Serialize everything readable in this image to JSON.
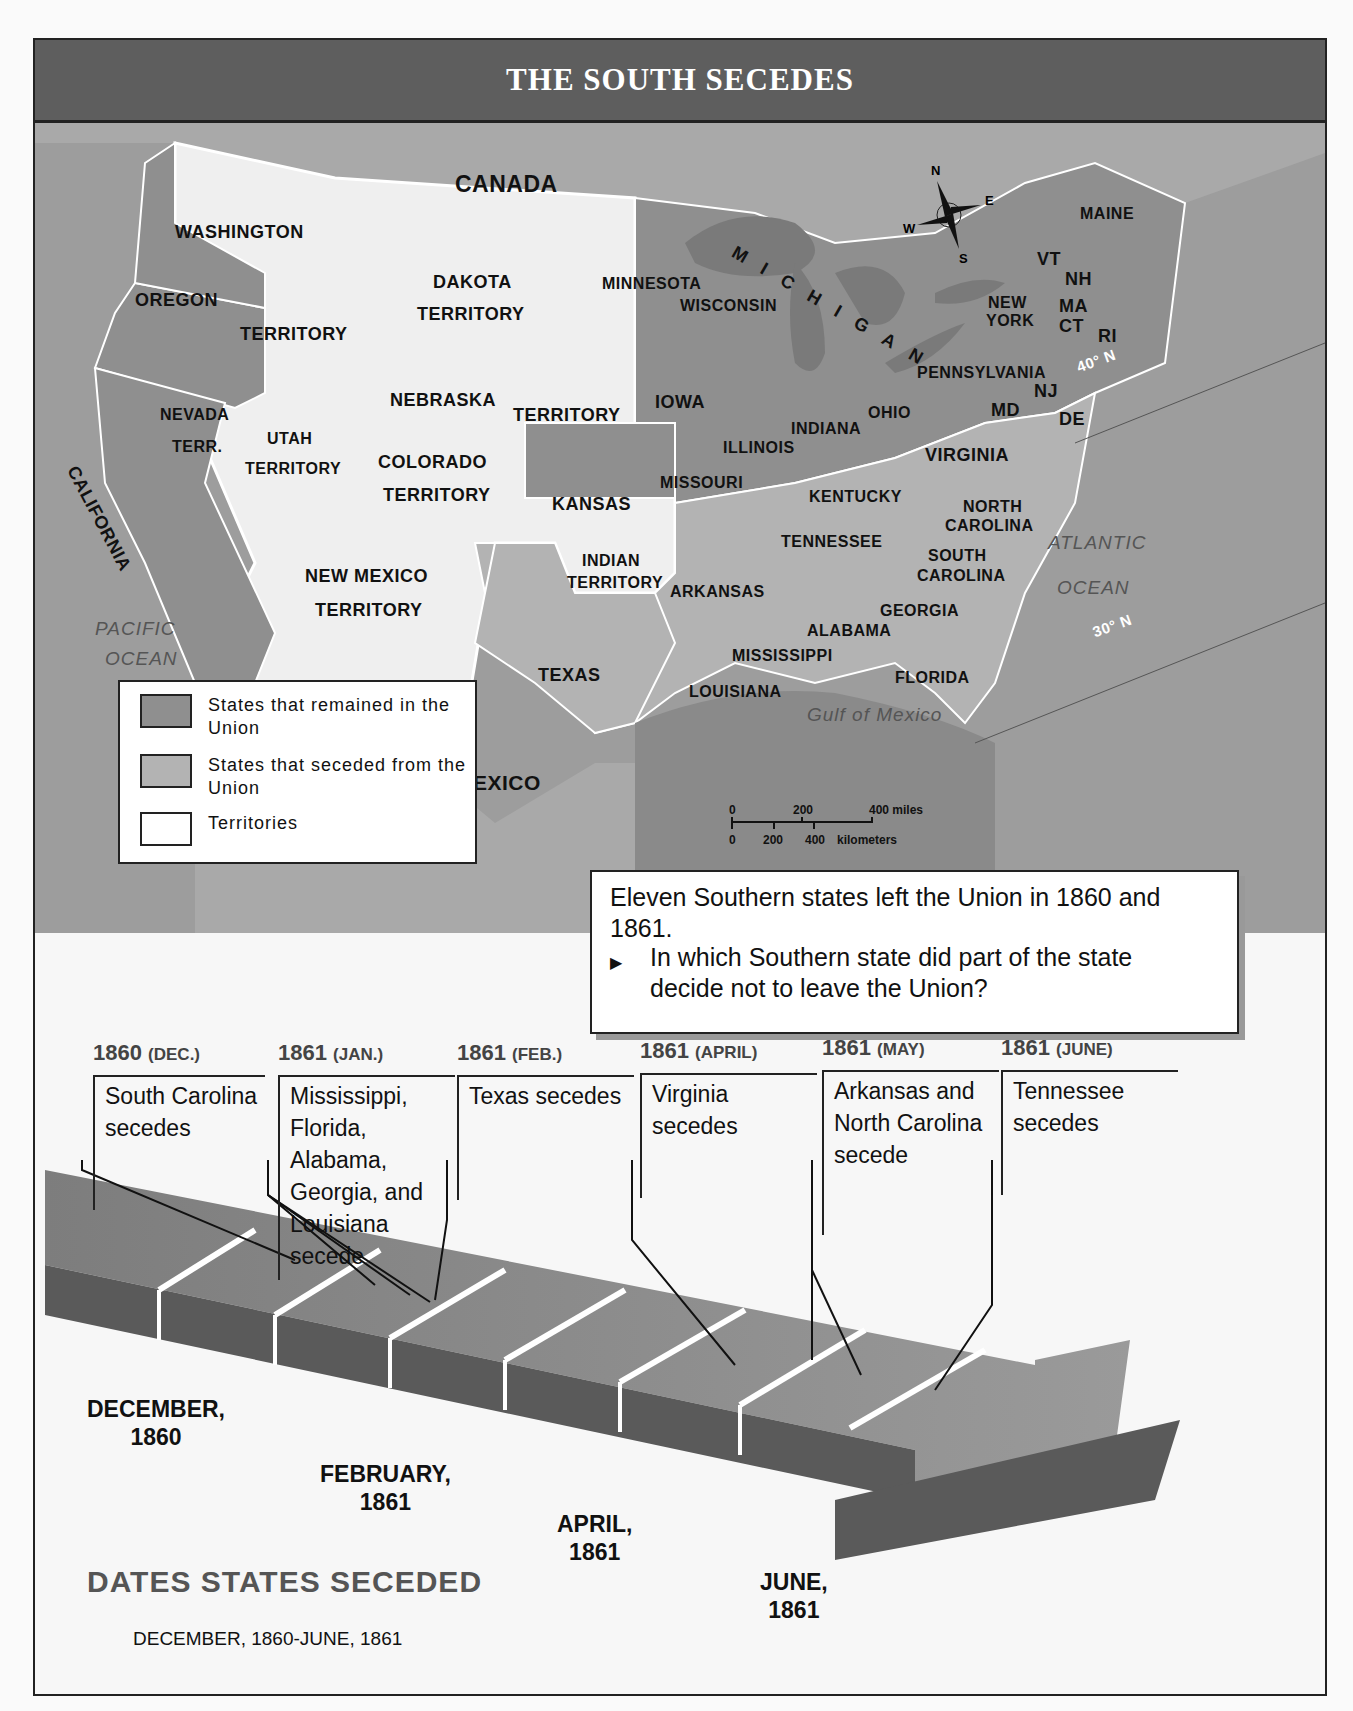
{
  "title": "THE SOUTH SECEDES",
  "colors": {
    "union": "#8f8f8f",
    "seceded": "#b3b3b3",
    "territory": "#efefef",
    "water": "#9a9a9a",
    "title_bar": "#5e5e5e"
  },
  "map": {
    "countries": [
      "CANADA",
      "MEXICO"
    ],
    "water_labels": [
      "PACIFIC",
      "OCEAN",
      "ATLANTIC",
      "OCEAN",
      "Gulf of Mexico",
      "MICHIGAN"
    ],
    "latitude_labels": [
      "40° N",
      "30° N"
    ],
    "compass": {
      "n": "N",
      "s": "S",
      "e": "E",
      "w": "W"
    },
    "states_union": [
      "WASHINGTON",
      "OREGON",
      "CALIFORNIA",
      "MINNESOTA",
      "WISCONSIN",
      "IOWA",
      "KANSAS",
      "MISSOURI",
      "ILLINOIS",
      "INDIANA",
      "OHIO",
      "KENTUCKY",
      "PENNSYLVANIA",
      "NEW YORK",
      "VT",
      "NH",
      "MAINE",
      "MA",
      "CT",
      "RI",
      "NJ",
      "DE",
      "MD"
    ],
    "states_seceded": [
      "VIRGINIA",
      "NORTH CAROLINA",
      "SOUTH CAROLINA",
      "TENNESSEE",
      "GEORGIA",
      "ALABAMA",
      "MISSISSIPPI",
      "FLORIDA",
      "LOUISIANA",
      "ARKANSAS",
      "TEXAS"
    ],
    "territories": [
      "WASHINGTON TERRITORY",
      "DAKOTA TERRITORY",
      "NEBRASKA TERRITORY",
      "NEVADA TERR.",
      "UTAH TERRITORY",
      "COLORADO TERRITORY",
      "NEW MEXICO TERRITORY",
      "INDIAN TERRITORY"
    ],
    "labels": {
      "canada": "CANADA",
      "mexico": "MEXICO",
      "washington": "WASHINGTON",
      "territory_wa": "TERRITORY",
      "oregon": "OREGON",
      "california": "CALIFORNIA",
      "nevada": "NEVADA",
      "terr": "TERR.",
      "utah": "UTAH",
      "utah_terr": "TERRITORY",
      "dakota": "DAKOTA",
      "dakota_terr": "TERRITORY",
      "nebraska": "NEBRASKA",
      "nebraska_terr": "TERRITORY",
      "colorado": "COLORADO",
      "colorado_terr": "TERRITORY",
      "new_mexico": "NEW MEXICO",
      "new_mexico_terr": "TERRITORY",
      "indian": "INDIAN",
      "indian_terr": "TERRITORY",
      "kansas": "KANSAS",
      "texas": "TEXAS",
      "minnesota": "MINNESOTA",
      "wisconsin": "WISCONSIN",
      "iowa": "IOWA",
      "missouri": "MISSOURI",
      "illinois": "ILLINOIS",
      "indiana": "INDIANA",
      "ohio": "OHIO",
      "kentucky": "KENTUCKY",
      "tennessee": "TENNESSEE",
      "arkansas": "ARKANSAS",
      "louisiana": "LOUISIANA",
      "mississippi": "MISSISSIPPI",
      "alabama": "ALABAMA",
      "georgia": "GEORGIA",
      "florida": "FLORIDA",
      "south_carolina_1": "SOUTH",
      "south_carolina_2": "CAROLINA",
      "north_carolina_1": "NORTH",
      "north_carolina_2": "CAROLINA",
      "virginia": "VIRGINIA",
      "md": "MD",
      "de": "DE",
      "nj": "NJ",
      "pennsylvania": "PENNSYLVANIA",
      "new_york_1": "NEW",
      "new_york_2": "YORK",
      "vt": "VT",
      "nh": "NH",
      "ma": "MA",
      "ct": "CT",
      "ri": "RI",
      "maine": "MAINE",
      "michigan": "MICHIGAN",
      "pacific": "PACIFIC",
      "pacific_ocean": "OCEAN",
      "atlantic": "ATLANTIC",
      "atlantic_ocean": "OCEAN",
      "gulf": "Gulf of Mexico",
      "lat40": "40° N",
      "lat30": "30° N"
    },
    "scale": {
      "miles": [
        "0",
        "200",
        "400 miles"
      ],
      "km": [
        "0",
        "200",
        "400",
        "kilometers"
      ]
    }
  },
  "legend": {
    "items": [
      {
        "label": "States that remained in the Union",
        "color": "#8f8f8f"
      },
      {
        "label": "States that seceded from the Union",
        "color": "#b3b3b3"
      },
      {
        "label": "Territories",
        "color": "#ffffff"
      }
    ]
  },
  "question_box": {
    "statement": "Eleven Southern states left the Union in 1860 and 1861.",
    "question": "In which Southern state did part of the state decide not to leave the Union?",
    "bullet": "▶"
  },
  "timeline": {
    "title": "DATES STATES SECEDED",
    "subtitle": "DECEMBER, 1860-JUNE, 1861",
    "events": [
      {
        "year": "1860",
        "month": "(DEC.)",
        "text": "South Carolina secedes"
      },
      {
        "year": "1861",
        "month": "(JAN.)",
        "text": "Mississippi, Florida, Alabama, Georgia, and Louisiana secede"
      },
      {
        "year": "1861",
        "month": "(FEB.)",
        "text": "Texas secedes"
      },
      {
        "year": "1861",
        "month": "(APRIL)",
        "text": "Virginia secedes"
      },
      {
        "year": "1861",
        "month": "(MAY)",
        "text": "Arkansas and North Carolina secede"
      },
      {
        "year": "1861",
        "month": "(JUNE)",
        "text": "Tennessee secedes"
      }
    ],
    "ticks": [
      {
        "month": "DECEMBER,",
        "year": "1860"
      },
      {
        "month": "FEBRUARY,",
        "year": "1861"
      },
      {
        "month": "APRIL,",
        "year": "1861"
      },
      {
        "month": "JUNE,",
        "year": "1861"
      }
    ]
  }
}
